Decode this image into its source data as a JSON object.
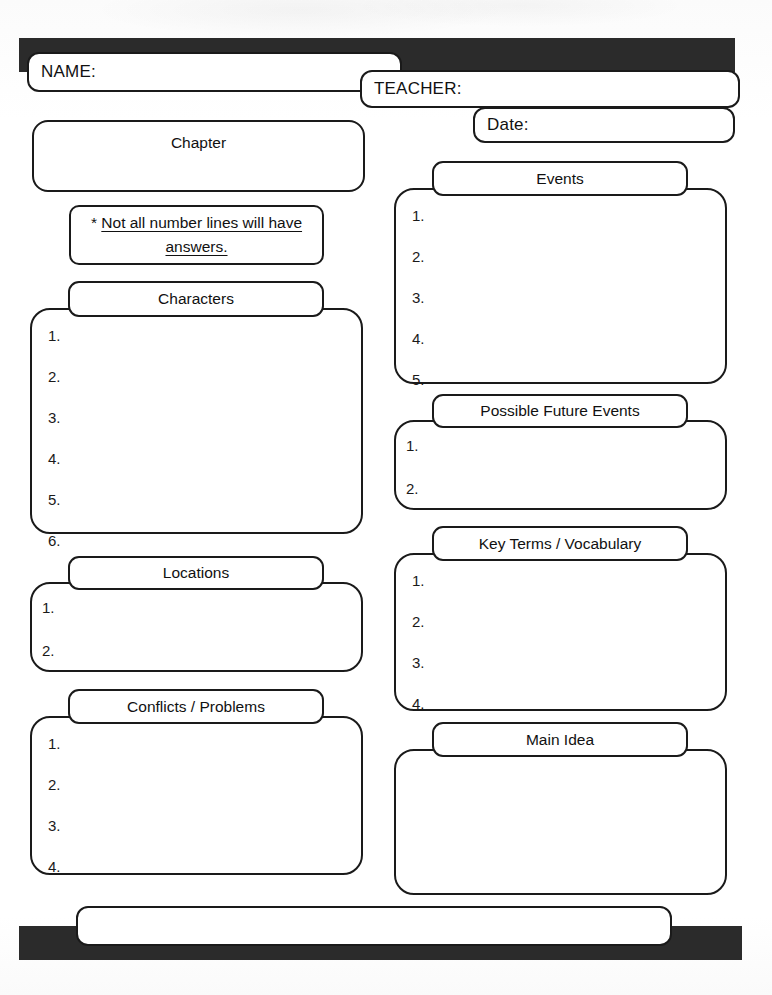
{
  "document": {
    "type": "worksheet",
    "title": "Chapter Reading Graphic Organizer"
  },
  "header": {
    "name_label": "NAME:",
    "teacher_label": "TEACHER:",
    "date_label": "Date:"
  },
  "chapter": {
    "label": "Chapter"
  },
  "note": {
    "bullet": "*",
    "text": "Not all number lines will have answers."
  },
  "sections": {
    "characters": {
      "title": "Characters",
      "items": [
        "1.",
        "2.",
        "3.",
        "4.",
        "5.",
        "6."
      ]
    },
    "locations": {
      "title": "Locations",
      "items": [
        "1.",
        "2."
      ]
    },
    "conflicts": {
      "title": "Conflicts / Problems",
      "items": [
        "1.",
        "2.",
        "3.",
        "4."
      ]
    },
    "events": {
      "title": "Events",
      "items": [
        "1.",
        "2.",
        "3.",
        "4.",
        "5."
      ]
    },
    "future_events": {
      "title": "Possible Future Events",
      "items": [
        "1.",
        "2."
      ]
    },
    "key_terms": {
      "title": "Key Terms / Vocabulary",
      "items": [
        "1.",
        "2.",
        "3.",
        "4."
      ]
    },
    "main_idea": {
      "title": "Main Idea",
      "items": []
    }
  },
  "footer": {
    "note_line": ""
  },
  "colors": {
    "slab": "#2b2b2b",
    "outline": "#1a1a1a",
    "paper": "#fdfdfd",
    "ink": "#111111"
  }
}
